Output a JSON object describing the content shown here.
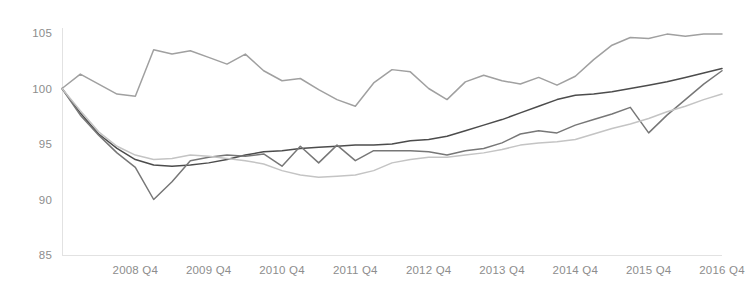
{
  "chart_data": {
    "type": "line",
    "title": "",
    "subtitle": "",
    "xlabel": "",
    "ylabel": "",
    "ylim": [
      85,
      105.8
    ],
    "yticks": [
      85,
      90,
      95,
      100,
      105
    ],
    "ytick_labels": [
      "85",
      "90",
      "95",
      "100",
      "105"
    ],
    "grid": false,
    "legend": "none",
    "x_tick_labels": [
      "2008 Q4",
      "2009 Q4",
      "2010 Q4",
      "2011 Q4",
      "2012 Q4",
      "2013 Q4",
      "2014 Q4",
      "2015 Q4",
      "2016 Q4"
    ],
    "x_tick_indices": [
      4,
      8,
      12,
      16,
      20,
      24,
      28,
      32,
      36
    ],
    "x": [
      "2007 Q4",
      "2008 Q1",
      "2008 Q2",
      "2008 Q3",
      "2008 Q4",
      "2009 Q1",
      "2009 Q2",
      "2009 Q3",
      "2009 Q4",
      "2010 Q1",
      "2010 Q2",
      "2010 Q3",
      "2010 Q4",
      "2011 Q1",
      "2011 Q2",
      "2011 Q3",
      "2011 Q4",
      "2012 Q1",
      "2012 Q2",
      "2012 Q3",
      "2012 Q4",
      "2013 Q1",
      "2013 Q2",
      "2013 Q3",
      "2013 Q4",
      "2014 Q1",
      "2014 Q2",
      "2014 Q3",
      "2014 Q4",
      "2015 Q1",
      "2015 Q2",
      "2015 Q3",
      "2015 Q4",
      "2016 Q1",
      "2016 Q2",
      "2016 Q3",
      "2016 Q4"
    ],
    "series": [
      {
        "name": "series-1-light-top",
        "color": "#a0a0a0",
        "values": [
          100.0,
          101.3,
          100.4,
          99.5,
          99.3,
          103.5,
          103.1,
          103.4,
          102.8,
          102.2,
          103.1,
          101.6,
          100.7,
          100.9,
          99.9,
          99.0,
          98.4,
          100.5,
          101.7,
          101.5,
          100.0,
          99.0,
          100.6,
          101.2,
          100.7,
          100.4,
          101.0,
          100.3,
          101.1,
          102.6,
          103.9,
          104.6,
          104.5,
          104.9,
          104.7,
          104.9,
          104.9
        ]
      },
      {
        "name": "series-2-dark",
        "color": "#4c4c4c",
        "values": [
          100.0,
          97.8,
          95.9,
          94.6,
          93.6,
          93.1,
          93.0,
          93.1,
          93.3,
          93.6,
          94.0,
          94.3,
          94.4,
          94.6,
          94.7,
          94.8,
          94.9,
          94.9,
          95.0,
          95.3,
          95.4,
          95.7,
          96.2,
          96.7,
          97.2,
          97.8,
          98.4,
          99.0,
          99.4,
          99.5,
          99.7,
          100.0,
          100.3,
          100.6,
          101.0,
          101.4,
          101.8
        ]
      },
      {
        "name": "series-3-medium",
        "color": "#777777",
        "values": [
          100.0,
          97.6,
          95.8,
          94.2,
          92.9,
          90.0,
          91.6,
          93.5,
          93.8,
          94.0,
          93.9,
          94.1,
          93.0,
          94.8,
          93.3,
          94.9,
          93.5,
          94.4,
          94.4,
          94.4,
          94.3,
          94.0,
          94.4,
          94.6,
          95.1,
          95.9,
          96.2,
          96.0,
          96.7,
          97.2,
          97.7,
          98.3,
          96.0,
          97.6,
          99.0,
          100.4,
          101.6
        ]
      },
      {
        "name": "series-4-lightest",
        "color": "#c4c4c4",
        "values": [
          100.0,
          98.0,
          96.1,
          94.8,
          94.0,
          93.6,
          93.7,
          94.0,
          93.9,
          93.7,
          93.5,
          93.2,
          92.6,
          92.2,
          92.0,
          92.1,
          92.2,
          92.6,
          93.3,
          93.6,
          93.8,
          93.8,
          94.0,
          94.2,
          94.5,
          94.9,
          95.1,
          95.2,
          95.4,
          95.9,
          96.4,
          96.8,
          97.3,
          97.9,
          98.4,
          99.0,
          99.5
        ]
      }
    ]
  },
  "axis": {
    "axis_color": "#e2e2e2",
    "label_color": "#8d8d8d"
  }
}
